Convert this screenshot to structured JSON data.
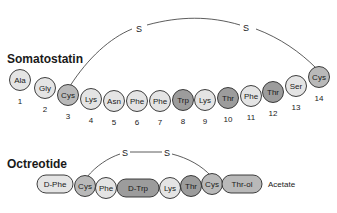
{
  "somatostatin": {
    "title": "Somatostatin",
    "disulfide": {
      "left_label": "S",
      "right_label": "S"
    },
    "residues": [
      {
        "name": "Ala",
        "num": "1",
        "shade": "light"
      },
      {
        "name": "Gly",
        "num": "2",
        "shade": "light"
      },
      {
        "name": "Cys",
        "num": "3",
        "shade": "mid"
      },
      {
        "name": "Lys",
        "num": "4",
        "shade": "light"
      },
      {
        "name": "Asn",
        "num": "5",
        "shade": "light"
      },
      {
        "name": "Phe",
        "num": "6",
        "shade": "light"
      },
      {
        "name": "Phe",
        "num": "7",
        "shade": "light"
      },
      {
        "name": "Trp",
        "num": "8",
        "shade": "dark"
      },
      {
        "name": "Lys",
        "num": "9",
        "shade": "light"
      },
      {
        "name": "Thr",
        "num": "10",
        "shade": "dark"
      },
      {
        "name": "Phe",
        "num": "11",
        "shade": "light"
      },
      {
        "name": "Thr",
        "num": "12",
        "shade": "dark"
      },
      {
        "name": "Ser",
        "num": "13",
        "shade": "light"
      },
      {
        "name": "Cys",
        "num": "14",
        "shade": "mid"
      }
    ]
  },
  "octreotide": {
    "title": "Octreotide",
    "disulfide": {
      "left_label": "S",
      "right_label": "S"
    },
    "residues": [
      {
        "name": "D-Phe",
        "shade": "light",
        "shape": "pill"
      },
      {
        "name": "Cys",
        "shade": "mid",
        "shape": "circle"
      },
      {
        "name": "Phe",
        "shade": "light",
        "shape": "circle"
      },
      {
        "name": "D-Trp",
        "shade": "dark",
        "shape": "pill"
      },
      {
        "name": "Lys",
        "shade": "light",
        "shape": "circle"
      },
      {
        "name": "Thr",
        "shade": "dark",
        "shape": "circle"
      },
      {
        "name": "Cys",
        "shade": "mid",
        "shape": "circle"
      },
      {
        "name": "Thr-ol",
        "shade": "mid",
        "shape": "pill"
      }
    ],
    "suffix": "Acetate"
  },
  "colors": {
    "light": "#e4e4e4",
    "mid": "#b9b9b9",
    "dark": "#9c9c9c",
    "stroke": "#2a2a2a"
  }
}
